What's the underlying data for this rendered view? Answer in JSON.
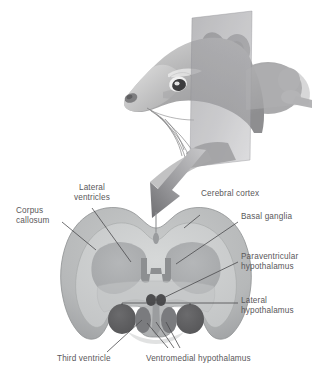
{
  "figure": {
    "background_color": "#ffffff",
    "label_color": "#59575a",
    "leader_line_color": "#4a4a4c"
  },
  "illustration": {
    "specimen": "rat-head-profile",
    "section_plane": {
      "name": "coronal-section-plane",
      "color": "#9a9a9c",
      "opacity": 0.55
    },
    "arrow": {
      "name": "section-direction-arrow",
      "color": "#8d8d90",
      "direction": "down-left"
    }
  },
  "brain_section": {
    "name": "coronal-brain-section",
    "regions": [
      {
        "key": "cerebral_cortex",
        "color": "#b9bbbd"
      },
      {
        "key": "corpus_callosum",
        "color": "#d2d4d5"
      },
      {
        "key": "basal_ganglia",
        "color": "#a9abad"
      },
      {
        "key": "lateral_ventricles",
        "color": "#8e9092"
      },
      {
        "key": "third_ventricle",
        "color": "#97999b"
      },
      {
        "key": "lateral_hypothalamus",
        "color": "#5e5e60"
      },
      {
        "key": "ventromedial_hypothalamus",
        "color": "#76777a"
      },
      {
        "key": "paraventricular_hypothalamus",
        "color": "#4d4d4f"
      }
    ]
  },
  "labels": {
    "lateral_ventricles": "Lateral\nventricles",
    "cerebral_cortex": "Cerebral cortex",
    "corpus_callosum": "Corpus\ncallosum",
    "basal_ganglia": "Basal ganglia",
    "paraventricular_hypothalamus": "Paraventricular\nhypothalamus",
    "lateral_hypothalamus": "Lateral\nhypothalamus",
    "third_ventricle": "Third ventricle",
    "ventromedial_hypothalamus": "Ventromedial hypothalamus"
  }
}
